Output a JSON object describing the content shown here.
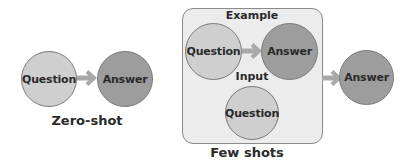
{
  "zero_shot": {
    "question_label": "Question",
    "answer_label": "Answer",
    "caption": "Zero-shot"
  },
  "few_shots": {
    "example_heading": "Example",
    "example_question_label": "Question",
    "example_answer_label": "Answer",
    "input_heading": "Input",
    "input_question_label": "Question",
    "output_answer_label": "Answer",
    "caption": "Few shots"
  },
  "colors": {
    "question_fill": "#cfcfcf",
    "answer_fill": "#9d9d9d",
    "circle_stroke": "#7a7a7a",
    "arrow": "#a8a8a8",
    "box_fill": "#ececec",
    "box_stroke": "#8a8a8a",
    "text": "#2a2a2a"
  }
}
